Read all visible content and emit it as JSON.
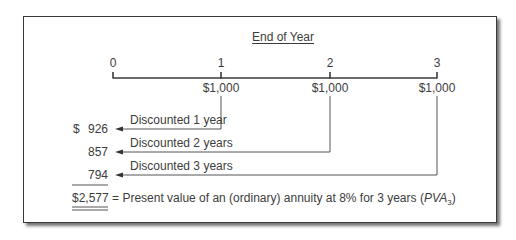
{
  "diagram": {
    "title": "End of Year",
    "timeline": {
      "ticks": [
        "0",
        "1",
        "2",
        "3"
      ],
      "payments": [
        "$1,000",
        "$1,000",
        "$1,000"
      ]
    },
    "discounts": [
      {
        "label": "Discounted 1 year",
        "value": "926",
        "prefix": "$"
      },
      {
        "label": "Discounted 2 years",
        "value": "857",
        "prefix": ""
      },
      {
        "label": "Discounted 3 years",
        "value": "794",
        "prefix": ""
      }
    ],
    "total": {
      "value": "$2,577",
      "description_prefix": "= Present value of an (ordinary) annuity at 8% for 3 years (",
      "symbol": "PVA",
      "subscript": "3",
      "description_suffix": ")"
    },
    "colors": {
      "line": "#3a3a3a",
      "text": "#3c3c3c",
      "background": "#ffffff"
    }
  }
}
